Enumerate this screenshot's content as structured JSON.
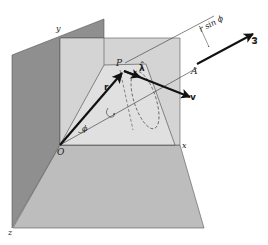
{
  "figure": {
    "type": "3d-vector-diagram",
    "colors": {
      "back_plane": "#8f8f8f",
      "xy_plane": "#d4d4d4",
      "floor_plane": "#bdbdbd",
      "inner_plane": "#e0e0e0",
      "lines": "#333333",
      "vectors": "#111111"
    },
    "labels": {
      "y_axis": "y",
      "x_axis": "x",
      "z_axis": "z",
      "origin": "O",
      "point_p": "P",
      "point_a": "A",
      "vector_r": "r",
      "vector_v": "v",
      "unit_lambda": "λ̂",
      "omega": "ω",
      "angle_phi": "ϕ",
      "distance": "r sin ϕ"
    }
  }
}
